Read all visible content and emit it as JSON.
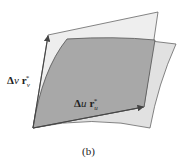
{
  "figure": {
    "caption": "(b)",
    "labels": {
      "dv_delta": "Δ",
      "dv_var": "v",
      "dv_vec": "r",
      "dv_sub": "v",
      "dv_sup": "*",
      "du_delta": "Δ",
      "du_var": "u",
      "du_vec": "r",
      "du_sub": "u",
      "du_sup": "*"
    },
    "colors": {
      "tangent_plane": "#e6e6e6",
      "surface_patch": "#d9d9d9",
      "overlap": "#a9a9a9",
      "edges": "#555555",
      "arrows": "#444444"
    }
  }
}
